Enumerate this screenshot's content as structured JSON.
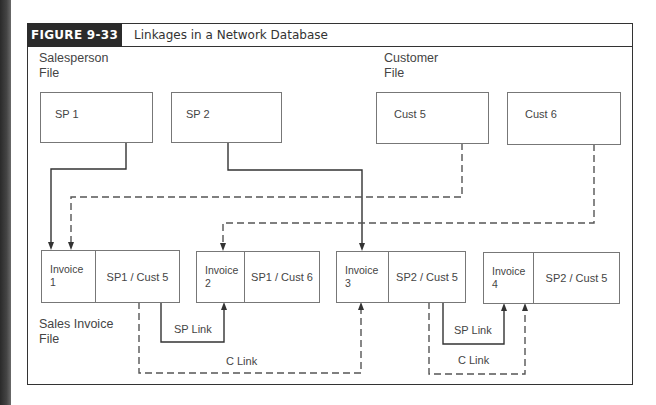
{
  "figure": {
    "label": "FIGURE 9-33",
    "title": "Linkages in a Network Database"
  },
  "files": {
    "salesperson": [
      "Salesperson",
      "File"
    ],
    "customer": [
      "Customer",
      "File"
    ],
    "sales_invoice": [
      "Sales Invoice",
      "File"
    ]
  },
  "salespersons": [
    {
      "label": "SP 1"
    },
    {
      "label": "SP 2"
    }
  ],
  "customers": [
    {
      "label": "Cust 5"
    },
    {
      "label": "Cust 6"
    }
  ],
  "invoices": [
    {
      "num_line1": "Invoice",
      "num_line2": "1",
      "record": "SP1 / Cust 5"
    },
    {
      "num_line1": "Invoice",
      "num_line2": "2",
      "record": "SP1 / Cust 6"
    },
    {
      "num_line1": "Invoice",
      "num_line2": "3",
      "record": "SP2 / Cust 5"
    },
    {
      "num_line1": "Invoice",
      "num_line2": "4",
      "record": "SP2 / Cust 5"
    }
  ],
  "links": {
    "sp_link": "SP Link",
    "c_link": "C Link"
  },
  "colors": {
    "solid_line": "#333333",
    "dashed_line": "#555555",
    "header_bg": "#2b2b2b"
  }
}
